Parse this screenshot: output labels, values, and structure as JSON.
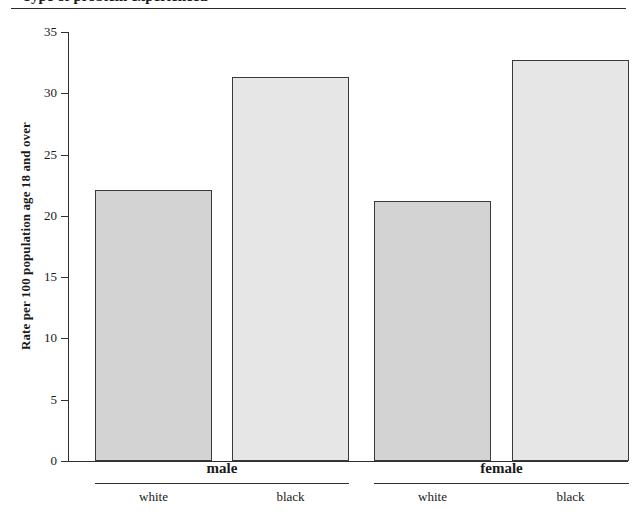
{
  "figure": {
    "title_partial": "Type of problem experienced",
    "ylabel": "Rate per 100 population age 18 and over"
  },
  "chart_data": {
    "type": "bar",
    "title": "",
    "xlabel": "",
    "ylabel": "Rate per 100 population age 18 and over",
    "ylim": [
      0,
      35
    ],
    "yticks": [
      0,
      5,
      10,
      15,
      20,
      25,
      30,
      35
    ],
    "ytick_labels": [
      "0",
      "5",
      "10",
      "15",
      "20",
      "25",
      "30",
      "35"
    ],
    "grid": false,
    "legend": "none",
    "groups": [
      {
        "label": "male",
        "categories": [
          "white",
          "black"
        ],
        "values": [
          22.1,
          31.3
        ]
      },
      {
        "label": "female",
        "categories": [
          "white",
          "black"
        ],
        "values": [
          21.2,
          32.7
        ]
      }
    ],
    "categories": [
      "white",
      "black",
      "white",
      "black"
    ],
    "values": [
      22.1,
      31.3,
      21.2,
      32.7
    ],
    "bar_colors": [
      "#d3d3d3",
      "#e6e6e6",
      "#d3d3d3",
      "#e6e6e6"
    ],
    "bar_edge_color": "#3a3a3a"
  }
}
